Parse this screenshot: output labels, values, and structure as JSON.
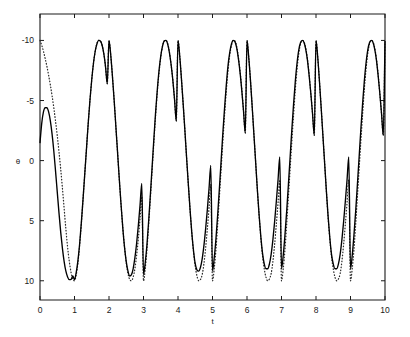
{
  "figure": {
    "background_color": "#ffffff",
    "foreground_color": "#1a1a1a",
    "width": 410,
    "height": 337
  },
  "axes": {
    "x_label": "t",
    "y_label": "θ",
    "x_ticks": [
      "0",
      "1",
      "2",
      "3",
      "4",
      "5",
      "6",
      "7",
      "8",
      "9",
      "10"
    ],
    "y_ticks": [
      "10",
      "5",
      "0",
      "-5",
      "-10"
    ]
  },
  "chart_data": {
    "type": "line",
    "title": "",
    "xlabel": "t",
    "ylabel": "θ",
    "xlim": [
      0,
      10
    ],
    "ylim": [
      -11.6,
      12.2
    ],
    "xticks": [
      0,
      1,
      2,
      3,
      4,
      5,
      6,
      7,
      8,
      9,
      10
    ],
    "yticks": [
      -10,
      -5,
      0,
      5,
      10
    ],
    "grid": false,
    "legend": null,
    "legend_position": "none",
    "series": [
      {
        "name": "solid",
        "style": "solid",
        "color": "#000000",
        "description": "Oscillation starting near theta=1.5 with a small first peak of about 4.4 at t=0.2, then full amplitude oscillation of period 2 with peaks at +10 and troughs rising slowly from -9.9 toward -9.0",
        "x": [
          0,
          0.05,
          0.1,
          0.15,
          0.2,
          0.25,
          0.3,
          0.35,
          0.4,
          0.45,
          0.5,
          0.55,
          0.6,
          0.65,
          0.7,
          0.75,
          0.8,
          0.85,
          0.9,
          0.95,
          1,
          1.05,
          1.1,
          1.15,
          1.2,
          1.25,
          1.3,
          1.35,
          1.4,
          1.45,
          1.5,
          1.55,
          1.6,
          1.65,
          1.7,
          1.75,
          1.8,
          1.85,
          1.9,
          1.95,
          2,
          2.05,
          2.1,
          2.15,
          2.2,
          2.25,
          2.3,
          2.35,
          2.4,
          2.45,
          2.5,
          2.55,
          2.6,
          2.65,
          2.7,
          2.75,
          2.8,
          2.85,
          2.9,
          2.95,
          3,
          3.05,
          3.1,
          3.15,
          3.2,
          3.25,
          3.3,
          3.35,
          3.4,
          3.45,
          3.5,
          3.55,
          3.6,
          3.65,
          3.7,
          3.75,
          3.8,
          3.85,
          3.9,
          3.95,
          4,
          4.05,
          4.1,
          4.15,
          4.2,
          4.25,
          4.3,
          4.35,
          4.4,
          4.45,
          4.5,
          4.55,
          4.6,
          4.65,
          4.7,
          4.75,
          4.8,
          4.85,
          4.9,
          4.95,
          5,
          5.05,
          5.1,
          5.15,
          5.2,
          5.25,
          5.3,
          5.35,
          5.4,
          5.45,
          5.5,
          5.55,
          5.6,
          5.65,
          5.7,
          5.75,
          5.8,
          5.85,
          5.9,
          5.95,
          6,
          6.05,
          6.1,
          6.15,
          6.2,
          6.25,
          6.3,
          6.35,
          6.4,
          6.45,
          6.5,
          6.55,
          6.6,
          6.65,
          6.7,
          6.75,
          6.8,
          6.85,
          6.9,
          6.95,
          7,
          7.05,
          7.1,
          7.15,
          7.2,
          7.25,
          7.3,
          7.35,
          7.4,
          7.45,
          7.5,
          7.55,
          7.6,
          7.65,
          7.7,
          7.75,
          7.8,
          7.85,
          7.9,
          7.95,
          8,
          8.05,
          8.1,
          8.15,
          8.2,
          8.25,
          8.3,
          8.35,
          8.4,
          8.45,
          8.5,
          8.55,
          8.6,
          8.65,
          8.7,
          8.75,
          8.8,
          8.85,
          8.9,
          8.95,
          9,
          9.05,
          9.1,
          9.15,
          9.2,
          9.25,
          9.3,
          9.35,
          9.4,
          9.45,
          9.5,
          9.55,
          9.6,
          9.65,
          9.7,
          9.75,
          9.8,
          9.85,
          9.9,
          9.95,
          10
        ],
        "y": [
          1.5,
          3.1,
          4.05,
          4.4,
          4.4,
          4.05,
          3.3,
          2.2,
          0.8,
          -0.85,
          -2.6,
          -4.35,
          -5.95,
          -7.3,
          -8.4,
          -9.2,
          -9.68,
          -9.9,
          -9.88,
          -9.6,
          -9.9,
          -9.3,
          -8.3,
          -6.9,
          -5.1,
          -3.1,
          -1.0,
          1.1,
          3.2,
          5.1,
          6.75,
          8.1,
          9.1,
          9.7,
          10,
          9.95,
          9.6,
          8.9,
          7.8,
          6.4,
          10,
          8.8,
          7.0,
          5.0,
          2.8,
          0.6,
          -1.6,
          -3.7,
          -5.6,
          -7.2,
          -8.4,
          -9.2,
          -9.6,
          -9.5,
          -9.0,
          -8.1,
          -6.9,
          -5.4,
          -3.7,
          -1.9,
          -9.5,
          -8.5,
          -7.0,
          -5.0,
          -2.8,
          -0.5,
          1.8,
          4.0,
          5.9,
          7.5,
          8.7,
          9.5,
          9.95,
          10,
          9.7,
          9.0,
          8.0,
          6.7,
          5.1,
          3.3,
          10,
          8.7,
          6.8,
          4.7,
          2.5,
          0.2,
          -2.0,
          -4.1,
          -6.0,
          -7.5,
          -8.6,
          -9.1,
          -9.2,
          -8.9,
          -8.2,
          -7.1,
          -5.7,
          -4.1,
          -2.3,
          -0.4,
          -9.2,
          -8.1,
          -6.5,
          -4.5,
          -2.3,
          0.0,
          2.3,
          4.4,
          6.3,
          7.9,
          9.0,
          9.7,
          10,
          9.9,
          9.4,
          8.5,
          7.3,
          5.8,
          4.1,
          2.3,
          10,
          8.6,
          6.7,
          4.5,
          2.2,
          -0.1,
          -2.4,
          -4.5,
          -6.3,
          -7.7,
          -8.6,
          -9.0,
          -9.0,
          -8.6,
          -7.8,
          -6.6,
          -5.1,
          -3.4,
          -1.6,
          0.3,
          -9.0,
          -7.9,
          -6.2,
          -4.2,
          -2.0,
          0.3,
          2.6,
          4.7,
          6.6,
          8.1,
          9.2,
          9.8,
          10,
          9.85,
          9.3,
          8.4,
          7.1,
          5.6,
          3.9,
          2.1,
          10,
          8.6,
          6.6,
          4.4,
          2.1,
          -0.2,
          -2.5,
          -4.6,
          -6.4,
          -7.8,
          -8.6,
          -9.0,
          -9.0,
          -8.6,
          -7.8,
          -6.6,
          -5.1,
          -3.4,
          -1.6,
          0.3,
          -9.0,
          -7.9,
          -6.2,
          -4.2,
          -2.0,
          0.3,
          2.6,
          4.7,
          6.6,
          8.1,
          9.2,
          9.8,
          10,
          9.85,
          9.3,
          8.4,
          7.1,
          5.6,
          3.9,
          2.1,
          9.9
        ]
      },
      {
        "name": "dotted",
        "style": "dotted",
        "color": "#2b2b2b",
        "description": "Oscillation starting at theta=10 at t=0 plunging steeply, converging with the solid curve by t=1, with troughs reaching about -10 at every odd t",
        "x": [
          0,
          0.05,
          0.1,
          0.15,
          0.2,
          0.25,
          0.3,
          0.35,
          0.4,
          0.45,
          0.5,
          0.55,
          0.6,
          0.65,
          0.7,
          0.75,
          0.8,
          0.85,
          0.9,
          0.95,
          1,
          1.05,
          1.1,
          1.15,
          1.2,
          1.25,
          1.3,
          1.35,
          1.4,
          1.45,
          1.5,
          1.55,
          1.6,
          1.65,
          1.7,
          1.75,
          1.8,
          1.85,
          1.9,
          1.95,
          2,
          2.05,
          2.1,
          2.15,
          2.2,
          2.25,
          2.3,
          2.35,
          2.4,
          2.45,
          2.5,
          2.55,
          2.6,
          2.65,
          2.7,
          2.75,
          2.8,
          2.85,
          2.9,
          2.95,
          3,
          3.05,
          3.1,
          3.15,
          3.2,
          3.25,
          3.3,
          3.35,
          3.4,
          3.45,
          3.5,
          3.55,
          3.6,
          3.65,
          3.7,
          3.75,
          3.8,
          3.85,
          3.9,
          3.95,
          4,
          4.05,
          4.1,
          4.15,
          4.2,
          4.25,
          4.3,
          4.35,
          4.4,
          4.45,
          4.5,
          4.55,
          4.6,
          4.65,
          4.7,
          4.75,
          4.8,
          4.85,
          4.9,
          4.95,
          5,
          5.05,
          5.1,
          5.15,
          5.2,
          5.25,
          5.3,
          5.35,
          5.4,
          5.45,
          5.5,
          5.55,
          5.6,
          5.65,
          5.7,
          5.75,
          5.8,
          5.85,
          5.9,
          5.95,
          6,
          6.05,
          6.1,
          6.15,
          6.2,
          6.25,
          6.3,
          6.35,
          6.4,
          6.45,
          6.5,
          6.55,
          6.6,
          6.65,
          6.7,
          6.75,
          6.8,
          6.85,
          6.9,
          6.95,
          7,
          7.05,
          7.1,
          7.15,
          7.2,
          7.25,
          7.3,
          7.35,
          7.4,
          7.45,
          7.5,
          7.55,
          7.6,
          7.65,
          7.7,
          7.75,
          7.8,
          7.85,
          7.9,
          7.95,
          8,
          8.05,
          8.1,
          8.15,
          8.2,
          8.25,
          8.3,
          8.35,
          8.4,
          8.45,
          8.5,
          8.55,
          8.6,
          8.65,
          8.7,
          8.75,
          8.8,
          8.85,
          8.9,
          8.95,
          9,
          9.05,
          9.1,
          9.15,
          9.2,
          9.25,
          9.3,
          9.35,
          9.4,
          9.45,
          9.5,
          9.55,
          9.6,
          9.65,
          9.7,
          9.75,
          9.8,
          9.85,
          9.9,
          9.95,
          10
        ],
        "y": [
          10,
          9.6,
          9.1,
          8.5,
          7.85,
          7.1,
          6.3,
          5.4,
          4.4,
          3.3,
          2.1,
          0.75,
          -0.7,
          -2.3,
          -4.0,
          -5.7,
          -7.2,
          -8.4,
          -9.3,
          -9.85,
          -10,
          -9.5,
          -8.5,
          -7.0,
          -5.2,
          -3.1,
          -1.0,
          1.1,
          3.2,
          5.1,
          6.75,
          8.1,
          9.1,
          9.75,
          10,
          9.95,
          9.6,
          8.9,
          7.8,
          6.4,
          10,
          8.8,
          7.0,
          5.0,
          2.8,
          0.6,
          -1.6,
          -3.7,
          -5.6,
          -7.2,
          -8.5,
          -9.4,
          -9.9,
          -10,
          -9.7,
          -9.0,
          -7.9,
          -6.5,
          -4.8,
          -3.0,
          -10,
          -9.0,
          -7.4,
          -5.3,
          -3.1,
          -0.8,
          1.5,
          3.7,
          5.7,
          7.3,
          8.6,
          9.5,
          9.95,
          10,
          9.75,
          9.05,
          8.0,
          6.7,
          5.1,
          3.3,
          10,
          8.7,
          6.8,
          4.7,
          2.5,
          0.2,
          -2.0,
          -4.1,
          -6.0,
          -7.6,
          -8.8,
          -9.6,
          -10,
          -9.9,
          -9.5,
          -8.6,
          -7.3,
          -5.7,
          -3.9,
          -2.0,
          -10,
          -9.0,
          -7.4,
          -5.3,
          -3.0,
          -0.7,
          1.6,
          3.8,
          5.8,
          7.5,
          8.8,
          9.6,
          10,
          9.95,
          9.5,
          8.6,
          7.4,
          5.9,
          4.1,
          2.3,
          10,
          8.6,
          6.7,
          4.5,
          2.2,
          -0.1,
          -2.4,
          -4.5,
          -6.4,
          -7.9,
          -9.0,
          -9.7,
          -10,
          -9.85,
          -9.4,
          -8.4,
          -7.0,
          -5.3,
          -3.5,
          -1.6,
          -10,
          -9.0,
          -7.4,
          -5.3,
          -3.0,
          -0.7,
          1.6,
          3.8,
          5.9,
          7.6,
          8.9,
          9.7,
          10,
          9.9,
          9.4,
          8.5,
          7.2,
          5.6,
          3.9,
          2.1,
          10,
          8.6,
          6.6,
          4.4,
          2.1,
          -0.2,
          -2.5,
          -4.7,
          -6.5,
          -8.0,
          -9.0,
          -9.7,
          -10,
          -9.85,
          -9.4,
          -8.4,
          -7.0,
          -5.3,
          -3.5,
          -1.6,
          -10,
          -9.0,
          -7.4,
          -5.3,
          -3.0,
          -0.7,
          1.6,
          3.8,
          5.9,
          7.6,
          8.9,
          9.7,
          10,
          9.9,
          9.4,
          8.5,
          7.2,
          5.6,
          3.9,
          2.1,
          9.9
        ]
      }
    ]
  }
}
